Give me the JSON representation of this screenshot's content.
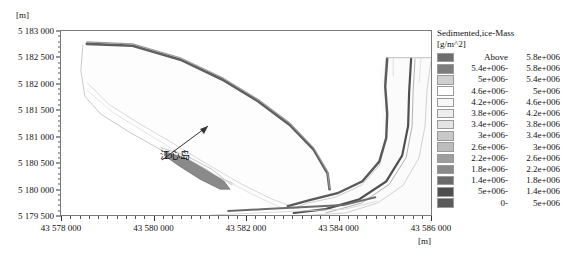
{
  "axes": {
    "y_unit": "[m]",
    "x_unit": "[m]",
    "y_ticks": [
      "5 183 000",
      "5 182 500",
      "5 182 000",
      "5 181 500",
      "5 181 000",
      "5 180 500",
      "5 180 000",
      "5 179 500"
    ],
    "x_ticks": [
      "43 578 000",
      "43 580 000",
      "43 582 000",
      "43 584 000",
      "43 586 000"
    ]
  },
  "annotation": {
    "label": "江心岛"
  },
  "legend": {
    "title": "Sedimented,ice-Mass",
    "unit": "[g/m^2]",
    "rows": [
      {
        "low": "Above",
        "high": "5.8e+006",
        "color": "#6e6e6e"
      },
      {
        "low": "5.4e+006-",
        "high": "5.8e+006",
        "color": "#7d7d7d"
      },
      {
        "low": "5e+006-",
        "high": "5.4e+006",
        "color": "#cfcfcf"
      },
      {
        "low": "4.6e+006-",
        "high": "5e+006",
        "color": "#ffffff"
      },
      {
        "low": "4.2e+006-",
        "high": "4.6e+006",
        "color": "#f7f7f7"
      },
      {
        "low": "3.8e+006-",
        "high": "4.2e+006",
        "color": "#ededed"
      },
      {
        "low": "3.4e+006-",
        "high": "3.8e+006",
        "color": "#e4e4e4"
      },
      {
        "low": "3e+006-",
        "high": "3.4e+006",
        "color": "#c8c8c8"
      },
      {
        "low": "2.6e+006-",
        "high": "3e+006",
        "color": "#bdbdbd"
      },
      {
        "low": "2.2e+006-",
        "high": "2.6e+006",
        "color": "#9e9e9e"
      },
      {
        "low": "1.8e+006-",
        "high": "2.2e+006",
        "color": "#8a8a8a"
      },
      {
        "low": "1.4e+006-",
        "high": "1.8e+006",
        "color": "#6a6a6a"
      },
      {
        "low": "5e+006-",
        "high": "1.4e+006",
        "color": "#4e4e4e"
      },
      {
        "low": "0-",
        "high": "5e+006",
        "color": "#5a5a5a"
      }
    ]
  },
  "chart_data": {
    "type": "heatmap",
    "title": "Sedimented,ice-Mass",
    "xlabel": "[m]",
    "ylabel": "[m]",
    "zlabel": "Sedimented,ice-Mass [g/m^2]",
    "xlim": [
      43578000,
      43586000
    ],
    "ylim": [
      5179500,
      5183000
    ],
    "x_tick_values": [
      43578000,
      43580000,
      43582000,
      43584000,
      43586000
    ],
    "y_tick_values": [
      5179500,
      5180000,
      5180500,
      5181000,
      5181500,
      5182000,
      5182500,
      5183000
    ],
    "grid": false,
    "legend_position": "right-outside",
    "colorbar_levels": [
      0,
      500000,
      1400000,
      1800000,
      2200000,
      2600000,
      3000000,
      3400000,
      3800000,
      4200000,
      4600000,
      5000000,
      5400000,
      5800000
    ],
    "annotations": [
      {
        "text": "江心岛",
        "x": 43581300,
        "y": 5180450,
        "points_to_x": 43581900,
        "points_to_y": 5181050
      }
    ]
  }
}
